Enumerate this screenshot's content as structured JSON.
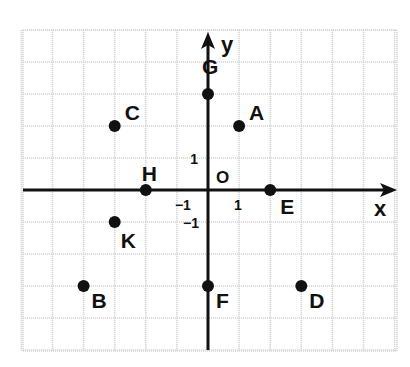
{
  "chart_data": {
    "type": "scatter",
    "title": "",
    "xlabel": "x",
    "ylabel": "y",
    "origin_label": "O",
    "xlim": [
      -6,
      6
    ],
    "ylim": [
      -5,
      5
    ],
    "grid": true,
    "tick_labels": [
      {
        "axis": "x",
        "value": -1,
        "text": "−1"
      },
      {
        "axis": "x",
        "value": 1,
        "text": "1"
      },
      {
        "axis": "y",
        "value": 1,
        "text": "1"
      },
      {
        "axis": "y",
        "value": -1,
        "text": "−1"
      }
    ],
    "points": [
      {
        "label": "A",
        "x": 1,
        "y": 2
      },
      {
        "label": "B",
        "x": -4,
        "y": -3
      },
      {
        "label": "C",
        "x": -3,
        "y": 2
      },
      {
        "label": "D",
        "x": 3,
        "y": -3
      },
      {
        "label": "E",
        "x": 2,
        "y": 0
      },
      {
        "label": "F",
        "x": 0,
        "y": -3
      },
      {
        "label": "G",
        "x": 0,
        "y": 3
      },
      {
        "label": "H",
        "x": -2,
        "y": 0
      },
      {
        "label": "K",
        "x": -3,
        "y": -1
      }
    ]
  },
  "colors": {
    "grid": "#d6d6d6",
    "axis": "#111111",
    "point": "#111111",
    "background": "#ffffff"
  }
}
